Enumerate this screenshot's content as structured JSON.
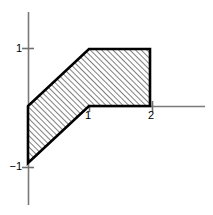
{
  "figure": {
    "title": "",
    "background_color": "#ffffff",
    "width": 213,
    "height": 215
  },
  "axes": {
    "x_axis_label": "",
    "y_axis_label": "",
    "axis_color": "#7a7a7a",
    "origin_label": "",
    "x_ticks": [
      {
        "value": 1,
        "label": "1"
      },
      {
        "value": 2,
        "label": "2"
      }
    ],
    "y_ticks": [
      {
        "value": 1,
        "label": "1"
      },
      {
        "value": -1,
        "label": "−1"
      }
    ]
  },
  "chart_data": {
    "type": "area",
    "title": "",
    "xlabel": "",
    "ylabel": "",
    "xlim": [
      -0.46,
      2.9
    ],
    "ylim": [
      -1.74,
      1.65
    ],
    "grid": false,
    "legend": null,
    "annotations": [],
    "outline_color": "#000000",
    "hatch_color": "#4d4d4d",
    "fill_color": "#ffffff",
    "hatch_pattern": "diagonal-45-ascending",
    "regions": [
      {
        "name": "hatched-region",
        "closed": true,
        "vertices": [
          {
            "x": 0,
            "y": -1
          },
          {
            "x": 0,
            "y": 0
          },
          {
            "x": 1,
            "y": 1
          },
          {
            "x": 2,
            "y": 1
          },
          {
            "x": 2,
            "y": 0
          },
          {
            "x": 1,
            "y": 0
          }
        ]
      }
    ],
    "boundary_segments": [
      {
        "name": "left-edge",
        "from": {
          "x": 0,
          "y": -1
        },
        "to": {
          "x": 0,
          "y": 0
        }
      },
      {
        "name": "upper-diagonal",
        "from": {
          "x": 0,
          "y": 0
        },
        "to": {
          "x": 1,
          "y": 1
        }
      },
      {
        "name": "top-edge",
        "from": {
          "x": 1,
          "y": 1
        },
        "to": {
          "x": 2,
          "y": 1
        }
      },
      {
        "name": "right-edge",
        "from": {
          "x": 2,
          "y": 1
        },
        "to": {
          "x": 2,
          "y": 0
        }
      },
      {
        "name": "bottom-edge",
        "from": {
          "x": 2,
          "y": 0
        },
        "to": {
          "x": 1,
          "y": 0
        }
      },
      {
        "name": "lower-diagonal",
        "from": {
          "x": 1,
          "y": 0
        },
        "to": {
          "x": 0,
          "y": -1
        }
      }
    ]
  }
}
